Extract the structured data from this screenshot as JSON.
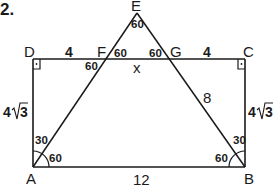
{
  "problem_number": "2.",
  "points": {
    "A": "A",
    "B": "B",
    "C": "C",
    "D": "D",
    "E": "E",
    "F": "F",
    "G": "G"
  },
  "lengths": {
    "DF": "4",
    "GC": "4",
    "FG": "x",
    "GB": "8",
    "AB": "12",
    "AD_coef": "4",
    "AD_rad": "3",
    "BC_coef": "4",
    "BC_rad": "3"
  },
  "angles": {
    "E": "60",
    "F_upper": "60",
    "F_lower": "60",
    "G_upper": "60",
    "A_upper": "30",
    "A_lower": "60",
    "B_upper": "30",
    "B_lower": "60"
  },
  "colors": {
    "stroke": "#1a1a1a",
    "background": "#ffffff"
  }
}
